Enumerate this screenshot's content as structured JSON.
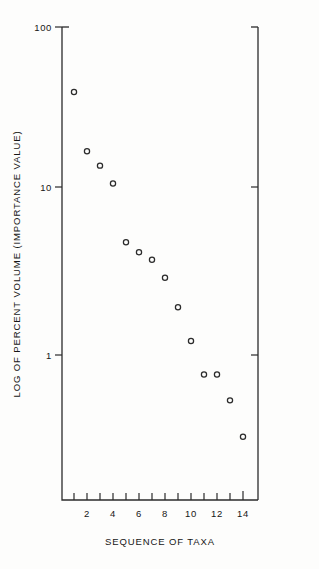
{
  "chart_data": {
    "type": "scatter",
    "title": "",
    "xlabel": "SEQUENCE OF TAXA",
    "ylabel": "LOG OF PERCENT VOLUME (IMPORTANCE VALUE)",
    "yscale": "log",
    "ylim": [
      0.2,
      100
    ],
    "xlim": [
      0.4,
      15.3
    ],
    "grid": false,
    "legend": null,
    "y_tick_labels": [
      "100",
      "10",
      "1"
    ],
    "y_tick_values": [
      100,
      10,
      1
    ],
    "x_tick_labels": [
      "2",
      "4",
      "6",
      "8",
      "10",
      "12",
      "14"
    ],
    "x_tick_values": [
      2,
      4,
      6,
      8,
      10,
      12,
      14
    ],
    "x_minor_ticks": [
      1,
      3,
      5,
      7,
      9,
      11,
      13,
      15
    ],
    "marker": "open-circle",
    "x": [
      1,
      2,
      3,
      4,
      5,
      6,
      7,
      8,
      9,
      10,
      11,
      12,
      13,
      14
    ],
    "values": [
      38.0,
      16.5,
      13.5,
      10.5,
      4.6,
      4.0,
      3.6,
      2.8,
      1.85,
      1.15,
      0.72,
      0.72,
      0.5,
      0.3
    ],
    "series": [
      {
        "name": "Percent volume by taxon rank",
        "points": [
          {
            "x": 1,
            "y": 38.0
          },
          {
            "x": 2,
            "y": 16.5
          },
          {
            "x": 3,
            "y": 13.5
          },
          {
            "x": 4,
            "y": 10.5
          },
          {
            "x": 5,
            "y": 4.6
          },
          {
            "x": 6,
            "y": 4.0
          },
          {
            "x": 7,
            "y": 3.6
          },
          {
            "x": 8,
            "y": 2.8
          },
          {
            "x": 9,
            "y": 1.85
          },
          {
            "x": 10,
            "y": 1.15
          },
          {
            "x": 11,
            "y": 0.72
          },
          {
            "x": 12,
            "y": 0.72
          },
          {
            "x": 13,
            "y": 0.5
          },
          {
            "x": 14,
            "y": 0.3
          }
        ]
      }
    ],
    "colors": {
      "marker": "#2b2b2b",
      "axis": "#2b2b2b",
      "background": "#fdfdfc"
    }
  }
}
